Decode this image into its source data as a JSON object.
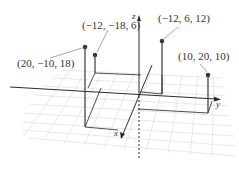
{
  "diagram": {
    "type": "3d-coordinate-plot",
    "axes": {
      "x_label": "x",
      "y_label": "y",
      "z_label": "z"
    },
    "points": [
      {
        "label": "(20, −10, 18)",
        "coords": [
          20,
          -10,
          18
        ]
      },
      {
        "label": "(−12, −18, 6)",
        "coords": [
          -12,
          -18,
          6
        ]
      },
      {
        "label": "(−12, 6, 12)",
        "coords": [
          -12,
          6,
          12
        ]
      },
      {
        "label": "(10, 20, 10)",
        "coords": [
          10,
          20,
          10
        ]
      }
    ],
    "colors": {
      "axis": "#2b2b2b",
      "grid": "#d6d6d6",
      "point": "#3a3a3a",
      "stem": "#3a3a3a",
      "text": "#333333"
    }
  }
}
